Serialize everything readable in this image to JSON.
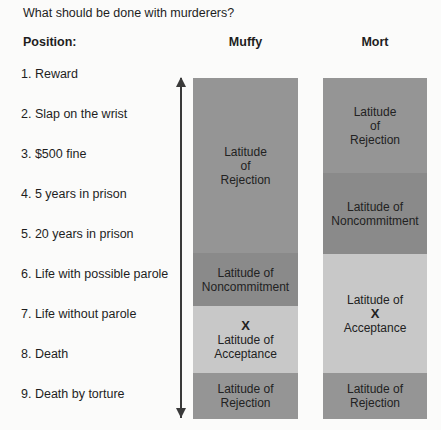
{
  "question": "What should be done with murderers?",
  "headers": {
    "position": "Position:",
    "muffy": "Muffy",
    "mort": "Mort"
  },
  "positions": [
    "1.  Reward",
    "2.  Slap on the wrist",
    "3.  $500 fine",
    "4.  5 years in prison",
    "5.  20 years in prison",
    "6.  Life with possible parole",
    "7.  Life without parole",
    "8.  Death",
    "9.  Death by torture"
  ],
  "colors": {
    "rejection": "#959595",
    "noncommitment": "#8a8a8a",
    "acceptance": "#c8c8c8"
  },
  "muffy": {
    "segments": [
      {
        "type": "rejection",
        "lines": [
          "Latitude",
          "of",
          "Rejection"
        ]
      },
      {
        "type": "noncommitment",
        "lines": [
          "Latitude of",
          "Noncommitment"
        ]
      },
      {
        "type": "acceptance",
        "mark": "X",
        "lines": [
          "Latitude of",
          "Acceptance"
        ]
      },
      {
        "type": "rejection",
        "lines": [
          "Latitude of",
          "Rejection"
        ]
      }
    ]
  },
  "mort": {
    "segments": [
      {
        "type": "rejection",
        "lines": [
          "Latitude",
          "of",
          "Rejection"
        ]
      },
      {
        "type": "noncommitment",
        "lines": [
          "Latitude of",
          "Noncommitment"
        ]
      },
      {
        "type": "acceptance",
        "mark": "X",
        "lines": [
          "Latitude of",
          "Acceptance"
        ]
      },
      {
        "type": "rejection",
        "lines": [
          "Latitude of",
          "Rejection"
        ]
      }
    ]
  }
}
